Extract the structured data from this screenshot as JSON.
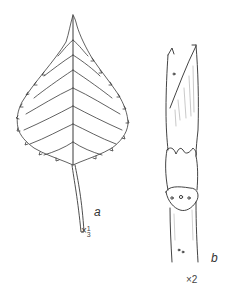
{
  "figure": {
    "panels": [
      {
        "id": "a",
        "label": "a",
        "subject": "leaf",
        "scale_prefix": "×",
        "scale_numerator": "1",
        "scale_denominator": "3"
      },
      {
        "id": "b",
        "label": "b",
        "subject": "twig-with-bud",
        "scale": "×2"
      }
    ],
    "colors": {
      "line": "#333333",
      "background": "#ffffff"
    }
  }
}
